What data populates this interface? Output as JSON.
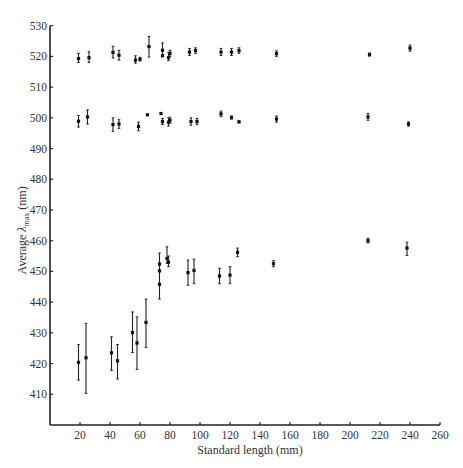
{
  "chart_data": {
    "type": "scatter",
    "title": "",
    "xlabel": "Standard length (mm)",
    "ylabel_parts": {
      "prefix": "Average ",
      "symbol": "λ",
      "subscript": "max",
      "suffix": " (nm)"
    },
    "xlim": [
      0,
      260
    ],
    "ylim": [
      400,
      530
    ],
    "xticks": [
      20,
      40,
      60,
      80,
      100,
      120,
      140,
      160,
      180,
      200,
      220,
      240,
      260
    ],
    "yticks": [
      410,
      420,
      430,
      440,
      450,
      460,
      470,
      480,
      490,
      500,
      510,
      520,
      530
    ],
    "grid": false,
    "legend": "none",
    "series": [
      {
        "name": "~520 nm pigment",
        "points": [
          {
            "x": 19,
            "y": 519.3,
            "low": 518.0,
            "high": 521.0
          },
          {
            "x": 26,
            "y": 519.6,
            "low": 518.0,
            "high": 521.5
          },
          {
            "x": 42,
            "y": 521.3,
            "low": 519.5,
            "high": 523.3
          },
          {
            "x": 46,
            "y": 520.4,
            "low": 518.8,
            "high": 522.0
          },
          {
            "x": 57,
            "y": 518.8,
            "low": 517.8,
            "high": 520.2
          },
          {
            "x": 60,
            "y": 519.1,
            "low": 518.5,
            "high": 519.7
          },
          {
            "x": 66,
            "y": 523.2,
            "low": 519.8,
            "high": 526.5
          },
          {
            "x": 75,
            "y": 522.0,
            "low": 520.6,
            "high": 524.4
          },
          {
            "x": 75,
            "y": 520.2,
            "low": 520.2,
            "high": 520.2
          },
          {
            "x": 79,
            "y": 519.6,
            "low": 518.6,
            "high": 521.2
          },
          {
            "x": 80,
            "y": 521.0,
            "low": 520.0,
            "high": 522.0
          },
          {
            "x": 93,
            "y": 521.4,
            "low": 520.3,
            "high": 522.6
          },
          {
            "x": 97,
            "y": 521.9,
            "low": 521.0,
            "high": 522.8
          },
          {
            "x": 114,
            "y": 521.4,
            "low": 520.3,
            "high": 522.6
          },
          {
            "x": 121,
            "y": 521.4,
            "low": 520.3,
            "high": 522.6
          },
          {
            "x": 126,
            "y": 521.9,
            "low": 521.0,
            "high": 522.8
          },
          {
            "x": 151,
            "y": 520.9,
            "low": 520.0,
            "high": 521.8
          },
          {
            "x": 213,
            "y": 520.6,
            "low": 520.1,
            "high": 521.1
          },
          {
            "x": 240,
            "y": 522.7,
            "low": 521.7,
            "high": 523.7
          }
        ]
      },
      {
        "name": "~500 nm pigment",
        "points": [
          {
            "x": 19,
            "y": 498.9,
            "low": 497.0,
            "high": 500.8
          },
          {
            "x": 25,
            "y": 500.3,
            "low": 498.0,
            "high": 502.6
          },
          {
            "x": 42,
            "y": 497.8,
            "low": 495.6,
            "high": 500.0
          },
          {
            "x": 46,
            "y": 498.0,
            "low": 496.6,
            "high": 499.4
          },
          {
            "x": 59,
            "y": 497.2,
            "low": 495.8,
            "high": 498.6
          },
          {
            "x": 65,
            "y": 501.0,
            "low": 501.0,
            "high": 501.0
          },
          {
            "x": 74,
            "y": 501.4,
            "low": 501.4,
            "high": 501.4
          },
          {
            "x": 75,
            "y": 498.8,
            "low": 497.8,
            "high": 499.8
          },
          {
            "x": 79,
            "y": 498.6,
            "low": 497.3,
            "high": 500.0
          },
          {
            "x": 80,
            "y": 499.2,
            "low": 498.2,
            "high": 500.2
          },
          {
            "x": 94,
            "y": 498.8,
            "low": 497.6,
            "high": 500.0
          },
          {
            "x": 98,
            "y": 498.8,
            "low": 497.8,
            "high": 499.8
          },
          {
            "x": 114,
            "y": 501.3,
            "low": 500.4,
            "high": 502.2
          },
          {
            "x": 121,
            "y": 500.1,
            "low": 499.6,
            "high": 500.6
          },
          {
            "x": 126,
            "y": 498.7,
            "low": 498.4,
            "high": 499.0
          },
          {
            "x": 151,
            "y": 499.6,
            "low": 498.6,
            "high": 500.6
          },
          {
            "x": 212,
            "y": 500.3,
            "low": 499.2,
            "high": 501.4
          },
          {
            "x": 239,
            "y": 498.0,
            "low": 497.3,
            "high": 498.7
          }
        ]
      },
      {
        "name": "short-wavelength pigment",
        "points": [
          {
            "x": 19,
            "y": 420.4,
            "low": 414.6,
            "high": 426.2
          },
          {
            "x": 24,
            "y": 421.9,
            "low": 410.3,
            "high": 433.1
          },
          {
            "x": 41,
            "y": 423.5,
            "low": 417.8,
            "high": 428.7
          },
          {
            "x": 45,
            "y": 420.9,
            "low": 415.0,
            "high": 426.2
          },
          {
            "x": 55,
            "y": 430.1,
            "low": 423.6,
            "high": 436.8
          },
          {
            "x": 58,
            "y": 426.7,
            "low": 418.1,
            "high": 435.2
          },
          {
            "x": 64,
            "y": 433.4,
            "low": 425.2,
            "high": 441.0
          },
          {
            "x": 73,
            "y": 445.8,
            "low": 441.0,
            "high": 456.0
          },
          {
            "x": 73,
            "y": 450.2,
            "low": 450.2,
            "high": 450.2
          },
          {
            "x": 73,
            "y": 452.4,
            "low": 452.4,
            "high": 452.4
          },
          {
            "x": 78,
            "y": 454.2,
            "low": 452.6,
            "high": 458.0
          },
          {
            "x": 79,
            "y": 453.0,
            "low": 451.6,
            "high": 455.0
          },
          {
            "x": 92,
            "y": 449.6,
            "low": 445.5,
            "high": 453.7
          },
          {
            "x": 96,
            "y": 450.3,
            "low": 446.0,
            "high": 454.0
          },
          {
            "x": 113,
            "y": 448.5,
            "low": 446.0,
            "high": 451.0
          },
          {
            "x": 120,
            "y": 448.8,
            "low": 446.0,
            "high": 451.5
          },
          {
            "x": 125,
            "y": 456.2,
            "low": 454.8,
            "high": 457.6
          },
          {
            "x": 149,
            "y": 452.5,
            "low": 451.5,
            "high": 453.5
          },
          {
            "x": 212,
            "y": 460.0,
            "low": 459.3,
            "high": 460.8
          },
          {
            "x": 238,
            "y": 457.6,
            "low": 455.2,
            "high": 459.5
          }
        ]
      }
    ]
  }
}
